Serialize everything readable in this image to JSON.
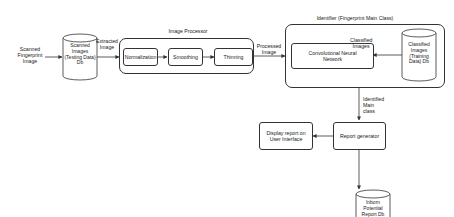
{
  "diagram": {
    "input_label": "Scanned Fingerprint Image",
    "scanned_db": "Scanned Images (Testing Data) Db",
    "extracted_label": "Extracted Image",
    "image_processor": {
      "title": "Image Processor",
      "steps": [
        "Normalization",
        "Smoothing",
        "Thinning"
      ]
    },
    "processed_label": "Processed Image",
    "identifier": {
      "title": "Identifier (Fingerprint Main Class)",
      "cnn": "Convolutional Neural Network",
      "classified_label": "Classified Images",
      "training_db": "Classified Images (Training Data) Db"
    },
    "identified_label": "Identified Main class",
    "report_generator": "Report generator",
    "display_report": "Display report on User Interface",
    "report_db": "Inborn Potential Report Db",
    "colors": {
      "stroke": "#333333",
      "background": "#ffffff"
    }
  }
}
